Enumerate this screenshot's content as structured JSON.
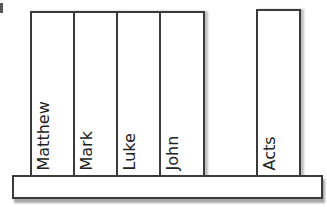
{
  "diagram": {
    "books": [
      {
        "label": "Matthew"
      },
      {
        "label": "Mark"
      },
      {
        "label": "Luke"
      },
      {
        "label": "John"
      },
      {
        "label": "Acts"
      }
    ],
    "shelf": {
      "label": ""
    },
    "colors": {
      "outline": "#3a3a3a",
      "fill": "#ffffff",
      "text": "#222222"
    }
  }
}
